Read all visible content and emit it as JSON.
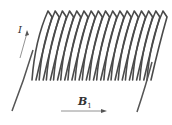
{
  "diagram": {
    "coil_turns": 17,
    "colors": {
      "wire": "#4a4a4a",
      "arrow": "#555555",
      "text": "#333333"
    },
    "labels": {
      "current": {
        "symbol": "I"
      },
      "field": {
        "symbol": "B",
        "subscript": "1"
      }
    },
    "arrows": [
      {
        "name": "current-direction",
        "direction": "up-right"
      },
      {
        "name": "magnetic-field-direction",
        "direction": "right"
      }
    ]
  }
}
